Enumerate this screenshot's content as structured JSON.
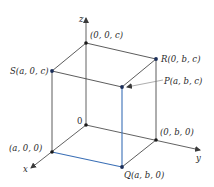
{
  "diagram": {
    "colors": {
      "edge": "#4a4a4a",
      "highlight": "#3a6fb6",
      "point": "#1c2f5a",
      "axis": "#3a3a3a",
      "leader": "#777777"
    },
    "axes": {
      "x": {
        "label": "x",
        "from": [
          86,
          125
        ],
        "to": [
          30,
          169
        ],
        "label_pos": [
          24,
          170
        ]
      },
      "y": {
        "label": "y",
        "from": [
          86,
          125
        ],
        "to": [
          201,
          150
        ],
        "label_pos": [
          196,
          160
        ]
      },
      "z": {
        "label": "z",
        "from": [
          86,
          125
        ],
        "to": [
          86,
          17
        ],
        "label_pos": [
          79,
          21
        ]
      }
    },
    "points": [
      {
        "id": "origin",
        "label": "0",
        "pos": [
          86,
          125
        ],
        "label_pos": [
          77,
          122
        ]
      },
      {
        "id": "a00",
        "label": "(a, 0, 0)",
        "pos": [
          52,
          152
        ],
        "label_pos": [
          9,
          150
        ]
      },
      {
        "id": "0b0",
        "label": "(0, b, 0)",
        "pos": [
          156,
          140
        ],
        "label_pos": [
          160,
          134
        ]
      },
      {
        "id": "Q",
        "label": "Q(a, b, 0)",
        "pos": [
          122,
          167
        ],
        "label_pos": [
          124,
          178
        ]
      },
      {
        "id": "00c",
        "label": "(0, 0, c)",
        "pos": [
          86,
          43
        ],
        "label_pos": [
          90,
          38
        ]
      },
      {
        "id": "S",
        "label": "S(a, 0, c)",
        "pos": [
          52,
          71
        ],
        "label_pos": [
          10,
          74
        ]
      },
      {
        "id": "R",
        "label": "R(0, b, c)",
        "pos": [
          156,
          59
        ],
        "label_pos": [
          162,
          61
        ]
      },
      {
        "id": "P",
        "label": "P(a, b, c)",
        "pos": [
          122,
          87
        ],
        "label_pos": [
          164,
          83
        ]
      }
    ],
    "labels": {
      "origin": "0",
      "a00": "(a, 0, 0)",
      "0b0": "(0, b, 0)",
      "Q": "Q(a, b, 0)",
      "00c": "(0, 0, c)",
      "S": "S(a, 0, c)",
      "R": "R(0, b, c)",
      "P": "P(a, b, c)",
      "x": "x",
      "y": "y",
      "z": "z"
    },
    "highlighted_edges": [
      [
        "a00",
        "Q"
      ],
      [
        "Q",
        "P"
      ]
    ]
  }
}
